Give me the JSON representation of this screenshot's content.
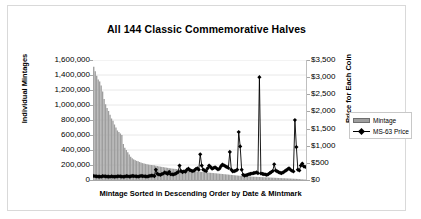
{
  "chart_data": {
    "type": "bar",
    "title": "All 144 Classic Commemorative Halves",
    "xlabel": "Mintage Sorted in Descending Order by Date & Mintmark",
    "ylabel": "Individual Mintages",
    "y2label": "Price for Each Coin",
    "grid": true,
    "legend_position": "right",
    "ylim": [
      0,
      1600000
    ],
    "y2lim": [
      0,
      3500
    ],
    "yticks": [
      0,
      200000,
      400000,
      600000,
      800000,
      1000000,
      1200000,
      1400000,
      1600000
    ],
    "ytick_labels": [
      "0",
      "200,000",
      "400,000",
      "600,000",
      "800,000",
      "1,000,000",
      "1,200,000",
      "1,400,000",
      "1,600,000"
    ],
    "y2ticks": [
      0,
      500,
      1000,
      1500,
      2000,
      2500,
      3000,
      3500
    ],
    "y2tick_labels": [
      "$0",
      "$500",
      "$1,000",
      "$1,500",
      "$2,000",
      "$2,500",
      "$3,000",
      "$3,500"
    ],
    "xtick_labels": [],
    "n_points": 144,
    "series": [
      {
        "name": "Mintage",
        "type": "bar",
        "axis": "left",
        "color": "#9e9e9e",
        "values": [
          1510000,
          1450000,
          1390000,
          1340000,
          1314000,
          1260000,
          1180000,
          1080000,
          1010000,
          960000,
          920000,
          870000,
          820000,
          790000,
          740000,
          700000,
          660000,
          640000,
          620000,
          600000,
          480000,
          430000,
          400000,
          370000,
          340000,
          310000,
          290000,
          275000,
          265000,
          255000,
          250000,
          240000,
          232000,
          225000,
          220000,
          215000,
          210000,
          206000,
          202000,
          200000,
          198000,
          195000,
          190000,
          186000,
          182000,
          178000,
          175000,
          172000,
          168000,
          165000,
          162000,
          158000,
          155000,
          152000,
          150000,
          148000,
          145000,
          142000,
          140000,
          138000,
          135000,
          132000,
          130000,
          128000,
          126000,
          124000,
          122000,
          120000,
          118000,
          116000,
          114000,
          112000,
          110000,
          108000,
          106000,
          104000,
          102000,
          100000,
          98000,
          96000,
          94000,
          92000,
          90000,
          88000,
          86000,
          84000,
          82000,
          80000,
          78000,
          76000,
          74000,
          72000,
          70000,
          68000,
          66000,
          64000,
          62000,
          60000,
          58000,
          56000,
          54000,
          52000,
          50000,
          49000,
          48000,
          47000,
          46000,
          45000,
          44000,
          43000,
          42000,
          41000,
          40000,
          39000,
          38000,
          37000,
          36000,
          35000,
          34000,
          33000,
          32000,
          31000,
          30000,
          29000,
          28000,
          27000,
          26000,
          25000,
          24000,
          23000,
          22000,
          21000,
          20000,
          19000,
          18000,
          17000,
          16000,
          15000,
          14000,
          12000,
          10000,
          8000,
          6000,
          5000
        ]
      },
      {
        "name": "MS-63 Price",
        "type": "line",
        "axis": "right",
        "color": "#000000",
        "marker": "diamond",
        "values": [
          120,
          110,
          105,
          100,
          100,
          95,
          115,
          110,
          105,
          100,
          100,
          95,
          110,
          100,
          95,
          100,
          105,
          110,
          105,
          100,
          95,
          100,
          115,
          110,
          100,
          105,
          120,
          115,
          110,
          105,
          100,
          110,
          120,
          115,
          110,
          105,
          100,
          110,
          120,
          130,
          125,
          115,
          300,
          180,
          160,
          150,
          170,
          190,
          220,
          200,
          180,
          240,
          170,
          165,
          160,
          180,
          200,
          230,
          420,
          260,
          230,
          250,
          240,
          300,
          330,
          290,
          270,
          260,
          280,
          320,
          340,
          300,
          750,
          420,
          300,
          280,
          260,
          340,
          420,
          380,
          330,
          350,
          370,
          340,
          310,
          330,
          400,
          450,
          430,
          400,
          380,
          350,
          820,
          300,
          250,
          260,
          270,
          300,
          1400,
          980,
          300,
          150,
          130,
          140,
          150,
          170,
          180,
          190,
          200,
          210,
          220,
          200,
          3000,
          190,
          180,
          170,
          160,
          150,
          170,
          200,
          230,
          260,
          460,
          280,
          250,
          230,
          210,
          200,
          220,
          250,
          280,
          310,
          340,
          300,
          270,
          250,
          1750,
          960,
          300,
          280,
          420,
          480,
          400,
          380
        ]
      }
    ]
  },
  "legend": {
    "items": [
      {
        "label": "Mintage",
        "swatch": "bar-swatch"
      },
      {
        "label": "MS-63 Price",
        "swatch": "line-marker-swatch"
      }
    ]
  },
  "colors": {
    "bar": "#9e9e9e",
    "line": "#000000",
    "grid": "#e8e8e8",
    "axis": "#a6a6a6",
    "frame_border": "#d9d9d9",
    "background": "#ffffff"
  }
}
